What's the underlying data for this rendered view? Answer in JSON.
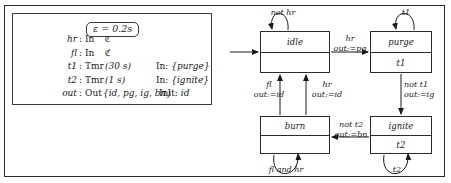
{
  "declarations": {
    "epsilon": {
      "symbol": "ε",
      "equals": "=",
      "value": "0.2s"
    },
    "rows": [
      {
        "name": "hr",
        "colon": ":",
        "kind": "In",
        "arg": "",
        "right": "",
        "type": "ℭ"
      },
      {
        "name": "fl",
        "colon": ":",
        "kind": "In",
        "arg": "",
        "right": "",
        "type": "ℭ"
      },
      {
        "name": "t1",
        "colon": ":",
        "kind": "Tmr",
        "arg": "(30 s)",
        "right_label": "In:",
        "right_value": "{purge}"
      },
      {
        "name": "t2",
        "colon": ":",
        "kind": "Tmr",
        "arg": "(1 s)",
        "right_label": "In:",
        "right_value": "{ignite}"
      },
      {
        "name": "out",
        "colon": ":",
        "kind": "Out",
        "arg": "{id, pg, ig, bn}",
        "right_label": "Init:",
        "right_value": "id"
      }
    ]
  },
  "state_machine": {
    "states": [
      {
        "id": "idle",
        "name": "idle",
        "lower": ""
      },
      {
        "id": "purge",
        "name": "purge",
        "lower": "t1"
      },
      {
        "id": "burn",
        "name": "burn",
        "lower": ""
      },
      {
        "id": "ignite",
        "name": "ignite",
        "lower": "t2"
      }
    ],
    "transitions": [
      {
        "id": "idle-self",
        "guard": "not hr",
        "action": ""
      },
      {
        "id": "purge-self",
        "guard": "t1",
        "action": ""
      },
      {
        "id": "burn-self",
        "guard": "fl and hr",
        "action": ""
      },
      {
        "id": "ignite-self",
        "guard": "t2",
        "action": ""
      },
      {
        "id": "idle-to-purge",
        "guard": "hr",
        "action": "out:=pg"
      },
      {
        "id": "purge-to-ignite",
        "guard": "not t1",
        "action": "out:=ig"
      },
      {
        "id": "ignite-to-burn",
        "guard": "not t2",
        "action": "out:=bn"
      },
      {
        "id": "burn-to-idle-fl",
        "guard": "fl",
        "action": "out:=id"
      },
      {
        "id": "burn-to-idle-hr",
        "guard": "hr",
        "action": "out:=id"
      }
    ]
  }
}
